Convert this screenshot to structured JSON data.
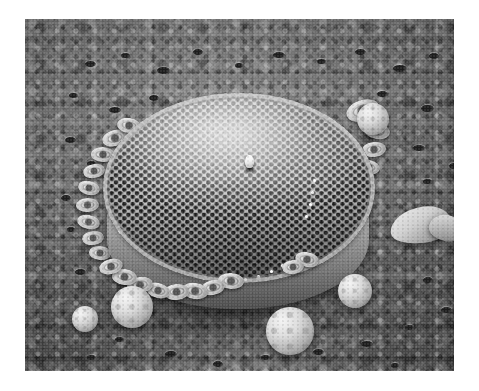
{
  "figure": {
    "domain": "scanning-electron-micrograph",
    "title": "",
    "caption": "",
    "color_mode": "grayscale",
    "border": {
      "color": "#ffffff",
      "left": 25,
      "top": 19,
      "right": 25,
      "bottom": 21
    },
    "plate": {
      "x": 25,
      "y": 19,
      "width": 429,
      "height": 352
    }
  },
  "palette": {
    "paper_white": "#ffffff",
    "background_mid_gray": "#6f6f6f",
    "background_dark": "#474747",
    "specimen_light": "#e3e3e3",
    "specimen_mid": "#b2b2b2",
    "pore_black": "#161616",
    "highlight_white": "#fdfdfd",
    "shadow_black": "#1d1d1d"
  },
  "scene": {
    "subject": "centric-diatom-frustule",
    "subject_shape": "drum",
    "substrate": "porous-filter-membrane",
    "lighting": "upper-left",
    "view": "oblique-valve-view"
  },
  "diatom": {
    "name": "diatom-frustule",
    "valve_face": {
      "name": "valve-face",
      "center": [
        196,
        122
      ],
      "radius_x": 136,
      "radius_y": 95,
      "areola_pattern": "quincunx-hexagonal",
      "areola_rows_estimate": 26,
      "areola_spacing_px": 8.4
    },
    "central_process": {
      "name": "central-rimoportula",
      "x": 224,
      "y": 150,
      "width": 9,
      "height": 13
    },
    "mantle": {
      "name": "girdle-mantle-band",
      "x": 82,
      "y": 150,
      "width": 262,
      "height": 140
    },
    "marginal_processes": [
      [
        92,
        212
      ],
      [
        97,
        222
      ],
      [
        104,
        231
      ],
      [
        113,
        239
      ],
      [
        124,
        246
      ],
      [
        136,
        251
      ],
      [
        149,
        255
      ],
      [
        163,
        258
      ],
      [
        177,
        260
      ],
      [
        191,
        261
      ],
      [
        205,
        261
      ],
      [
        219,
        259
      ],
      [
        232,
        256
      ],
      [
        245,
        251
      ],
      [
        256,
        245
      ],
      [
        280,
        196
      ],
      [
        284,
        184
      ],
      [
        286,
        172
      ],
      [
        288,
        160
      ]
    ]
  },
  "coccoliths": [
    {
      "x": 338,
      "y": 92,
      "size": 34,
      "tilt": -18
    },
    {
      "x": 352,
      "y": 112,
      "size": 26,
      "tilt": 10
    },
    {
      "x": 349,
      "y": 130,
      "size": 24,
      "tilt": -6
    },
    {
      "x": 344,
      "y": 148,
      "size": 22,
      "tilt": 14
    },
    {
      "x": 336,
      "y": 166,
      "size": 22,
      "tilt": -10
    },
    {
      "x": 330,
      "y": 183,
      "size": 24,
      "tilt": 6
    },
    {
      "x": 320,
      "y": 200,
      "size": 26,
      "tilt": -14
    },
    {
      "x": 309,
      "y": 216,
      "size": 27,
      "tilt": 8
    },
    {
      "x": 296,
      "y": 229,
      "size": 25,
      "tilt": -4
    },
    {
      "x": 282,
      "y": 240,
      "size": 24,
      "tilt": 12
    },
    {
      "x": 268,
      "y": 248,
      "size": 22,
      "tilt": -8
    },
    {
      "x": 206,
      "y": 262,
      "size": 26,
      "tilt": 4
    },
    {
      "x": 188,
      "y": 268,
      "size": 24,
      "tilt": -12
    },
    {
      "x": 170,
      "y": 272,
      "size": 26,
      "tilt": 9
    },
    {
      "x": 151,
      "y": 273,
      "size": 25,
      "tilt": -5
    },
    {
      "x": 133,
      "y": 271,
      "size": 24,
      "tilt": 15
    },
    {
      "x": 115,
      "y": 266,
      "size": 26,
      "tilt": -9
    },
    {
      "x": 99,
      "y": 258,
      "size": 25,
      "tilt": 7
    },
    {
      "x": 86,
      "y": 247,
      "size": 24,
      "tilt": -15
    },
    {
      "x": 75,
      "y": 234,
      "size": 22,
      "tilt": 5
    },
    {
      "x": 68,
      "y": 219,
      "size": 22,
      "tilt": -7
    },
    {
      "x": 63,
      "y": 203,
      "size": 23,
      "tilt": 11
    },
    {
      "x": 62,
      "y": 186,
      "size": 23,
      "tilt": -3
    },
    {
      "x": 64,
      "y": 169,
      "size": 22,
      "tilt": 13
    },
    {
      "x": 69,
      "y": 152,
      "size": 22,
      "tilt": -11
    },
    {
      "x": 78,
      "y": 135,
      "size": 24,
      "tilt": 2
    },
    {
      "x": 90,
      "y": 119,
      "size": 26,
      "tilt": -16
    },
    {
      "x": 104,
      "y": 106,
      "size": 24,
      "tilt": 9
    }
  ],
  "coccospheres": [
    {
      "name": "coccosphere-bottom-center",
      "x": 265,
      "y": 312,
      "size": 48
    },
    {
      "name": "coccosphere-lower-left",
      "x": 107,
      "y": 288,
      "size": 42
    },
    {
      "name": "coccosphere-left-margin",
      "x": 60,
      "y": 300,
      "size": 26
    },
    {
      "name": "coccosphere-right-cluster",
      "x": 330,
      "y": 272,
      "size": 34
    },
    {
      "name": "coccosphere-upper-right",
      "x": 348,
      "y": 100,
      "size": 32
    }
  ],
  "debris": [
    {
      "name": "debris-fragment-right",
      "x": 390,
      "y": 207,
      "width": 62,
      "height": 36
    },
    {
      "name": "debris-fragment-right2",
      "x": 429,
      "y": 215,
      "width": 34,
      "height": 26
    }
  ],
  "membrane_pores": [
    [
      60,
      42,
      11,
      6
    ],
    [
      96,
      34,
      9,
      5
    ],
    [
      132,
      48,
      13,
      7
    ],
    [
      168,
      30,
      10,
      6
    ],
    [
      210,
      44,
      8,
      5
    ],
    [
      248,
      33,
      12,
      6
    ],
    [
      292,
      40,
      9,
      5
    ],
    [
      330,
      30,
      11,
      6
    ],
    [
      368,
      46,
      14,
      7
    ],
    [
      404,
      34,
      10,
      6
    ],
    [
      430,
      58,
      12,
      7
    ],
    [
      44,
      74,
      9,
      5
    ],
    [
      84,
      88,
      12,
      6
    ],
    [
      124,
      76,
      10,
      6
    ],
    [
      166,
      92,
      8,
      5
    ],
    [
      206,
      78,
      9,
      5
    ],
    [
      352,
      72,
      11,
      6
    ],
    [
      396,
      86,
      13,
      7
    ],
    [
      432,
      100,
      9,
      5
    ],
    [
      40,
      118,
      11,
      6
    ],
    [
      62,
      142,
      9,
      5
    ],
    [
      388,
      126,
      12,
      6
    ],
    [
      424,
      144,
      10,
      6
    ],
    [
      398,
      160,
      9,
      5
    ],
    [
      36,
      176,
      10,
      6
    ],
    [
      42,
      208,
      8,
      5
    ],
    [
      50,
      250,
      11,
      6
    ],
    [
      90,
      318,
      9,
      5
    ],
    [
      140,
      332,
      12,
      6
    ],
    [
      188,
      342,
      10,
      6
    ],
    [
      236,
      336,
      9,
      5
    ],
    [
      288,
      330,
      11,
      6
    ],
    [
      336,
      322,
      12,
      6
    ],
    [
      380,
      306,
      9,
      5
    ],
    [
      416,
      288,
      11,
      6
    ],
    [
      398,
      258,
      10,
      6
    ],
    [
      366,
      344,
      8,
      5
    ],
    [
      118,
      352,
      10,
      5
    ],
    [
      62,
      336,
      9,
      5
    ],
    [
      428,
      200,
      9,
      5
    ]
  ]
}
